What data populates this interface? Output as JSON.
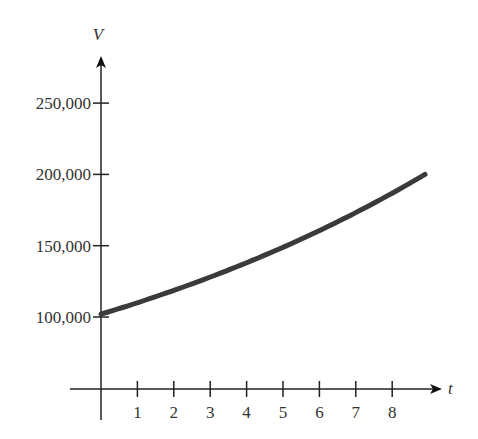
{
  "chart_data": {
    "type": "line",
    "title": "",
    "xlabel": "t",
    "ylabel": "V",
    "x_ticks": [
      "1",
      "2",
      "3",
      "4",
      "5",
      "6",
      "7",
      "8"
    ],
    "y_ticks": [
      "100,000",
      "150,000",
      "200,000",
      "250,000"
    ],
    "xlim": [
      0,
      9
    ],
    "ylim": [
      100000,
      260000
    ],
    "grid": false,
    "legend": null,
    "series": [
      {
        "name": "V",
        "x": [
          0,
          1,
          2,
          3,
          4,
          5,
          6,
          7,
          8,
          8.9
        ],
        "values": [
          102000,
          110000,
          118500,
          127500,
          137500,
          148000,
          159500,
          172000,
          185500,
          200000
        ]
      }
    ],
    "colors": {
      "curve": "#3a3a3a",
      "axis": "#222222"
    }
  }
}
